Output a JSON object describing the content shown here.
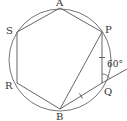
{
  "diagram": {
    "type": "geometry",
    "colors": {
      "stroke": "#555555",
      "text": "#333333",
      "background": "#ffffff"
    },
    "circle": {
      "cx": 60,
      "cy": 60,
      "r": 51
    },
    "vertices": {
      "A": {
        "label": "A",
        "x": 60,
        "y": 8
      },
      "S": {
        "label": "S",
        "x": 17,
        "y": 32
      },
      "R": {
        "label": "R",
        "x": 17,
        "y": 83
      },
      "B": {
        "label": "B",
        "x": 60,
        "y": 109
      },
      "Q": {
        "label": "Q",
        "x": 102,
        "y": 83
      },
      "P": {
        "label": "P",
        "x": 102,
        "y": 32
      }
    },
    "segments": [
      "AS",
      "SR",
      "RB",
      "BQ",
      "QP",
      "PA",
      "PB"
    ],
    "extension": {
      "from": "B",
      "through": "Q",
      "to": {
        "x": 127,
        "y": 69
      }
    },
    "tick_marks": [
      {
        "segment": "PQ",
        "count": 1
      },
      {
        "segment": "BQ",
        "count": 1
      }
    ],
    "angle": {
      "at": "Q",
      "label": "60°",
      "between": [
        "QP",
        "extension of BQ"
      ]
    }
  }
}
